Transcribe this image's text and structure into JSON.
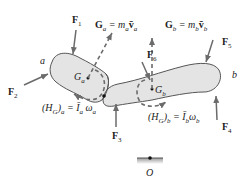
{
  "diagram": {
    "bodies": [
      {
        "id": "a",
        "label": "a",
        "center_label": "G",
        "center_sub": "a"
      },
      {
        "id": "b",
        "label": "b",
        "center_label": "G",
        "center_sub": "b"
      }
    ],
    "forces": [
      {
        "name": "F",
        "sub": "1"
      },
      {
        "name": "F",
        "sub": "2"
      },
      {
        "name": "F",
        "sub": "3"
      },
      {
        "name": "F",
        "sub": "4"
      },
      {
        "name": "F",
        "sub": "5"
      },
      {
        "name": "F",
        "sub": "6"
      }
    ],
    "momentum_a": "Gₐ = mₐv̄ₐ",
    "momentum_a_parts": {
      "lhs": "G",
      "lhs_sub": "a",
      "eq": " = m",
      "m_sub": "a",
      "v": "v̄",
      "v_sub": "a"
    },
    "momentum_b_parts": {
      "lhs": "G",
      "lhs_sub": "b",
      "eq": " = m",
      "m_sub": "b",
      "v": "v̄",
      "v_sub": "b"
    },
    "angular_a_parts": {
      "pre": "(H",
      "g": "G",
      "post": ")",
      "sub": "a",
      "eq": " = Ī",
      "i_sub": "a",
      "w": " ω",
      "w_sub": "a"
    },
    "angular_b_parts": {
      "pre": "(H",
      "g": "G",
      "post": ")",
      "sub": "b",
      "eq": " = Ī",
      "i_sub": "b",
      "w": "ω",
      "w_sub": "b"
    },
    "origin_label": "O",
    "colors": {
      "body_fill": "#e4e4e4",
      "stroke": "#555555",
      "arrow": "#6b6b6b"
    }
  }
}
